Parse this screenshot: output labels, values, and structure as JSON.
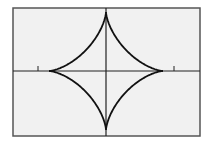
{
  "figure": {
    "type": "astroid",
    "background": "#f1f1f1",
    "frame_color": "#555555",
    "curve_color": "#111111",
    "axis_color": "#222222",
    "frame": {
      "x": 13,
      "y": 8,
      "width": 187,
      "height": 128
    },
    "origin": {
      "x": 106,
      "y": 71
    },
    "radius_x": 57,
    "radius_y": 59,
    "ticks": [
      {
        "x": 38
      },
      {
        "x": 174
      }
    ],
    "tick_length": 5
  }
}
